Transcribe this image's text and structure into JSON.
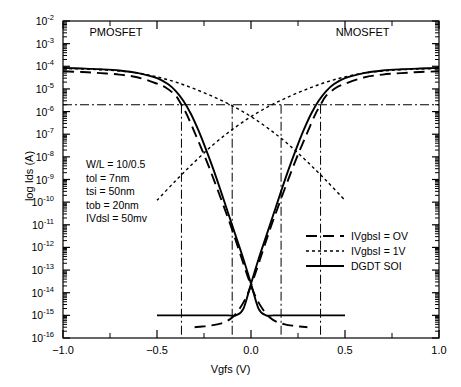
{
  "chart_data": {
    "type": "line",
    "title": "",
    "xlabel": "Vgfs (V)",
    "ylabel": "log Ids (A)",
    "xlim": [
      -1.0,
      1.0
    ],
    "ylim": [
      1e-16,
      0.01
    ],
    "yscale": "log",
    "grid": false,
    "legend_position": "lower right",
    "xticks": [
      "-1.0",
      "-0.5",
      "0.0",
      "0.5",
      "1.0"
    ],
    "xtick_values": [
      -1.0,
      -0.5,
      0.0,
      0.5,
      1.0
    ],
    "yticks": [
      "-2",
      "-3",
      "-4",
      "-5",
      "-6",
      "-7",
      "-8",
      "-9",
      "-10",
      "-11",
      "-12",
      "-13",
      "-14",
      "-15",
      "-16"
    ],
    "ytick_values": [
      0.01,
      0.001,
      0.0001,
      1e-05,
      1e-06,
      1e-07,
      1e-08,
      1e-09,
      1e-10,
      1e-11,
      1e-12,
      1e-13,
      1e-14,
      1e-15,
      1e-16
    ],
    "region_labels": [
      {
        "text": "PMOSFET",
        "x": -0.7,
        "y": 0.003
      },
      {
        "text": "NMOSFET",
        "x": 0.61,
        "y": 0.003
      }
    ],
    "markers": {
      "hline_value": 2e-06,
      "vline_values": [
        -0.37,
        -0.1,
        0.16,
        0.37
      ],
      "line_style": "dash-dot"
    },
    "series": [
      {
        "name": "IVgbsI = OV",
        "style": "dashed",
        "branch": "pmos",
        "x": [
          -1.0,
          -0.9,
          -0.8,
          -0.7,
          -0.6,
          -0.5,
          -0.45,
          -0.4,
          -0.37,
          -0.34,
          -0.3,
          -0.26,
          -0.22,
          -0.18,
          -0.14,
          -0.1,
          -0.06,
          -0.02,
          0.02,
          0.06,
          0.1,
          0.14,
          0.18,
          0.22,
          0.26,
          0.3
        ],
        "y": [
          6e-05,
          5.6e-05,
          5e-05,
          4.3e-05,
          3.2e-05,
          1.7e-05,
          1.1e-05,
          5e-06,
          2e-06,
          7e-07,
          1.2e-07,
          2e-08,
          3e-09,
          4e-10,
          5e-11,
          6e-12,
          6e-13,
          6e-14,
          8e-15,
          2e-15,
          8e-16,
          5e-16,
          4e-16,
          3.5e-16,
          3.2e-16,
          3e-16
        ]
      },
      {
        "name": "IVgbsI = OV",
        "style": "dashed",
        "branch": "nmos",
        "x": [
          1.0,
          0.9,
          0.8,
          0.7,
          0.6,
          0.5,
          0.45,
          0.4,
          0.37,
          0.34,
          0.3,
          0.26,
          0.22,
          0.18,
          0.14,
          0.1,
          0.06,
          0.02,
          -0.02,
          -0.06,
          -0.1,
          -0.14,
          -0.18,
          -0.22,
          -0.26,
          -0.3
        ],
        "y": [
          6e-05,
          5.6e-05,
          5e-05,
          4.3e-05,
          3.2e-05,
          1.7e-05,
          1.1e-05,
          5e-06,
          2e-06,
          7e-07,
          1.2e-07,
          2e-08,
          3e-09,
          4e-10,
          5e-11,
          6e-12,
          6e-13,
          6e-14,
          8e-15,
          2e-15,
          8e-16,
          5e-16,
          4e-16,
          3.5e-16,
          3.2e-16,
          3e-16
        ]
      },
      {
        "name": "IVgbsI = 1V",
        "style": "dotted",
        "branch": "pmos",
        "x": [
          -1.0,
          -0.9,
          -0.8,
          -0.7,
          -0.6,
          -0.5,
          -0.4,
          -0.3,
          -0.2,
          -0.1,
          0.0,
          0.1,
          0.2,
          0.3,
          0.4,
          0.5
        ],
        "y": [
          8e-05,
          7.6e-05,
          7e-05,
          6.2e-05,
          5e-05,
          3.4e-05,
          2e-05,
          1e-05,
          4.5e-06,
          1.8e-06,
          6e-07,
          1.6e-07,
          3.5e-08,
          6e-09,
          9e-10,
          1.2e-10
        ]
      },
      {
        "name": "IVgbsI = 1V",
        "style": "dotted",
        "branch": "nmos",
        "x": [
          1.0,
          0.9,
          0.8,
          0.7,
          0.6,
          0.5,
          0.4,
          0.3,
          0.2,
          0.1,
          0.0,
          -0.1,
          -0.2,
          -0.3,
          -0.4,
          -0.5
        ],
        "y": [
          8e-05,
          7.6e-05,
          7e-05,
          6.2e-05,
          5e-05,
          3.4e-05,
          2e-05,
          1e-05,
          4.5e-06,
          1.8e-06,
          6e-07,
          1.6e-07,
          3.5e-08,
          6e-09,
          9e-10,
          1.2e-10
        ]
      },
      {
        "name": "DGDT SOI",
        "style": "solid",
        "branch": "pmos",
        "x": [
          -1.0,
          -0.9,
          -0.8,
          -0.7,
          -0.6,
          -0.5,
          -0.44,
          -0.4,
          -0.36,
          -0.32,
          -0.28,
          -0.24,
          -0.2,
          -0.16,
          -0.12,
          -0.08,
          -0.04,
          0.0,
          0.04,
          0.08,
          0.12,
          0.16,
          0.22,
          0.3,
          0.4,
          0.5
        ],
        "y": [
          8.5e-05,
          8e-05,
          7.4e-05,
          6.5e-05,
          5e-05,
          3e-05,
          1.6e-05,
          8e-06,
          3e-06,
          8e-07,
          1.5e-07,
          2.2e-08,
          2.8e-09,
          3e-10,
          3e-11,
          3e-12,
          3e-13,
          2.5e-14,
          2e-15,
          1e-15,
          1e-15,
          1e-15,
          1e-15,
          1e-15,
          1e-15,
          1e-15
        ]
      },
      {
        "name": "DGDT SOI",
        "style": "solid",
        "branch": "nmos",
        "x": [
          1.0,
          0.9,
          0.8,
          0.7,
          0.6,
          0.5,
          0.44,
          0.4,
          0.36,
          0.32,
          0.28,
          0.24,
          0.2,
          0.16,
          0.12,
          0.08,
          0.04,
          0.0,
          -0.04,
          -0.08,
          -0.12,
          -0.16,
          -0.22,
          -0.3,
          -0.4,
          -0.5
        ],
        "y": [
          8.5e-05,
          8e-05,
          7.4e-05,
          6.5e-05,
          5e-05,
          3e-05,
          1.6e-05,
          8e-06,
          3e-06,
          8e-07,
          1.5e-07,
          2.2e-08,
          2.8e-09,
          3e-10,
          3e-11,
          3e-12,
          3e-13,
          2.5e-14,
          2e-15,
          1e-15,
          1e-15,
          1e-15,
          1e-15,
          1e-15,
          1e-15,
          1e-15
        ]
      }
    ],
    "annotations": [
      "W/L = 10/0.5",
      "tol = 7nm",
      "tsi = 50nm",
      "tob = 20nm",
      "IVdsl = 50mv"
    ]
  },
  "legend": {
    "items": [
      {
        "label": "IVgbsI = OV",
        "style": "dashed"
      },
      {
        "label": "IVgbsI = 1V",
        "style": "dotted"
      },
      {
        "label": "DGDT SOI",
        "style": "solid"
      }
    ]
  },
  "caption": {
    "text": ""
  }
}
